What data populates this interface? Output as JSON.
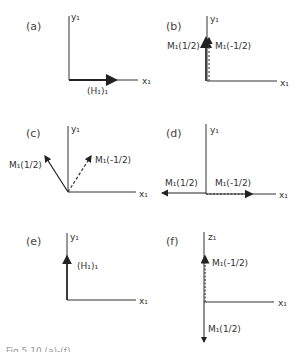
{
  "figure": {
    "caption": "Fig.5.10 (a)-(f)",
    "panels": [
      {
        "id": "a",
        "label": "(a)",
        "y_axis": "y₁",
        "x_axis": "x₁",
        "vectors": [
          {
            "label": "(H₁)₁",
            "direction": "+x",
            "style": "solid"
          }
        ]
      },
      {
        "id": "b",
        "label": "(b)",
        "y_axis": "y₁",
        "x_axis": "x₁",
        "vectors": [
          {
            "label": "M₁(1/2)",
            "direction": "+y",
            "style": "solid"
          },
          {
            "label": "M₁(-1/2)",
            "direction": "+y",
            "style": "dashed"
          }
        ]
      },
      {
        "id": "c",
        "label": "(c)",
        "y_axis": "y₁",
        "x_axis": "x₁",
        "vectors": [
          {
            "label": "M₁(1/2)",
            "direction": "up-left",
            "style": "solid"
          },
          {
            "label": "M₁(-1/2)",
            "direction": "up-right",
            "style": "dashed"
          }
        ]
      },
      {
        "id": "d",
        "label": "(d)",
        "y_axis": "y₁",
        "x_axis": "x₁",
        "vectors": [
          {
            "label": "M₁(1/2)",
            "direction": "-x",
            "style": "solid"
          },
          {
            "label": "M₁(-1/2)",
            "direction": "+x",
            "style": "dashed"
          }
        ]
      },
      {
        "id": "e",
        "label": "(e)",
        "y_axis": "y₁",
        "x_axis": "x₁",
        "vectors": [
          {
            "label": "(H₁)₁",
            "direction": "+y",
            "style": "solid"
          }
        ]
      },
      {
        "id": "f",
        "label": "(f)",
        "y_axis": "z₁",
        "x_axis": "x₁",
        "vectors": [
          {
            "label": "M₁(-1/2)",
            "direction": "+z",
            "style": "dashed"
          },
          {
            "label": "M₁(1/2)",
            "direction": "-z",
            "style": "solid"
          }
        ]
      }
    ]
  }
}
